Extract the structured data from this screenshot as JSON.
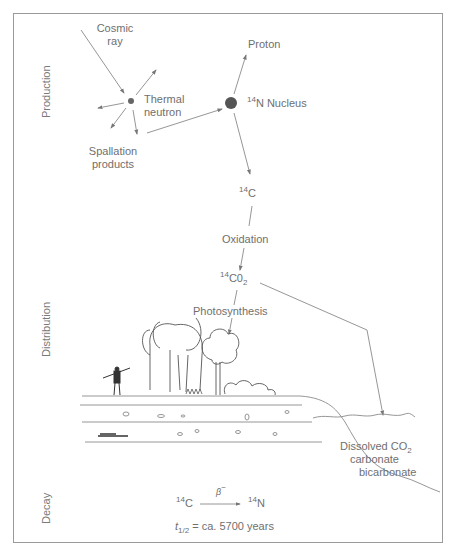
{
  "sections": {
    "production": "Production",
    "distribution": "Distribution",
    "decay": "Decay"
  },
  "labels": {
    "cosmic_ray_1": "Cosmic",
    "cosmic_ray_2": "ray",
    "thermal_neutron_1": "Thermal",
    "thermal_neutron_2": "neutron",
    "spallation_1": "Spallation",
    "spallation_2": "products",
    "proton": "Proton",
    "n14_mass": "14",
    "n14_text": "N Nucleus",
    "c14_mass": "14",
    "c14_symbol": "C",
    "oxidation": "Oxidation",
    "co2_mass": "14",
    "co2_symbol": "C0",
    "co2_sub": "2",
    "photosynthesis": "Photosynthesis",
    "dissolved_1": "Dissolved CO",
    "dissolved_sub": "2",
    "dissolved_2": "carbonate",
    "dissolved_3": "bicarbonate"
  },
  "decay": {
    "beta": "β",
    "beta_sup": "−",
    "from_mass": "14",
    "from_symbol": "C",
    "to_mass": "14",
    "to_symbol": "N",
    "halflife_t": "t",
    "halflife_sub": "1/2",
    "halflife_text": " = ca. 5700 years"
  },
  "colors": {
    "line": "#8a8a8a",
    "text": "#6f6f6f",
    "frame": "#9a9a9a",
    "nucleus": "#555555"
  }
}
